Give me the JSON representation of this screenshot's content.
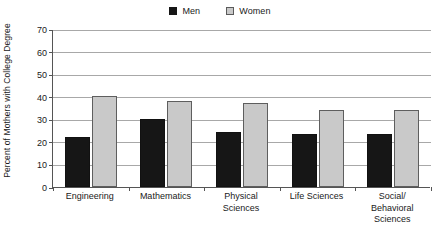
{
  "chart_data": {
    "type": "bar",
    "title": "",
    "subtitle": "",
    "xlabel": "",
    "ylabel": "Percent of Mothers with College Degree",
    "categories": [
      "Engineering",
      "Mathematics",
      "Physical Sciences",
      "Life Sciences",
      "Social/ Behavioral Sciences"
    ],
    "category_lines": [
      [
        "Engineering"
      ],
      [
        "Mathematics"
      ],
      [
        "Physical",
        "Sciences"
      ],
      [
        "Life Sciences"
      ],
      [
        "Social/",
        "Behavioral",
        "Sciences"
      ]
    ],
    "series": [
      {
        "name": "Men",
        "color": "#161616",
        "border_color": "#111111",
        "values": [
          22,
          30,
          24.5,
          23.5,
          23.5
        ]
      },
      {
        "name": "Women",
        "color": "#c9c9c9",
        "border_color": "#5e5e5e",
        "values": [
          40.5,
          38,
          37,
          34,
          34
        ]
      }
    ],
    "ylim": [
      0,
      70
    ],
    "ytick_step": 10,
    "yticks": [
      0,
      10,
      20,
      30,
      40,
      50,
      60,
      70
    ],
    "ytick_labels": [
      "0",
      "10",
      "20",
      "30",
      "40",
      "50",
      "60",
      "70"
    ],
    "grid": true,
    "grid_axis": "y",
    "legend_position": "top-center",
    "axis_color": "#555555",
    "gridline_color": "#a8a8a8",
    "background": "#ffffff"
  },
  "legend": {
    "entries": [
      {
        "label": "Men",
        "swatch": "men-swatch"
      },
      {
        "label": "Women",
        "swatch": "women-swatch"
      }
    ]
  }
}
